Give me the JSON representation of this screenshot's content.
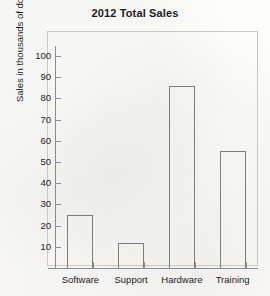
{
  "chart_data": {
    "type": "bar",
    "title": "2012 Total Sales",
    "xlabel": "",
    "ylabel": "Sales in thousands of dollars",
    "categories": [
      "Software",
      "Support",
      "Hardware",
      "Training"
    ],
    "values": [
      25,
      12,
      86,
      55
    ],
    "ylim": [
      0,
      105
    ],
    "yticks": [
      10,
      20,
      30,
      40,
      50,
      60,
      70,
      80,
      90,
      100
    ],
    "ytick_labels": [
      "10",
      "20",
      "30",
      "40",
      "50",
      "60",
      "70",
      "80",
      "90",
      "100"
    ],
    "grid": false,
    "legend": false,
    "legend_position": "none",
    "series": [
      {
        "name": "Total Sales",
        "values": [
          25,
          12,
          86,
          55
        ]
      }
    ],
    "colors": {
      "bar_outline": "#7d7d7d",
      "bar_fill": "transparent",
      "axis": "#8c8c8c",
      "frame": "#c9c9c9",
      "text": "#1b1b1b",
      "background": "#fdfdfb"
    }
  }
}
